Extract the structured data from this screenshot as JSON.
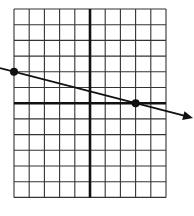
{
  "chart_data": {
    "type": "line",
    "title": "",
    "xlabel": "",
    "ylabel": "",
    "grid": true,
    "xlim": [
      -5,
      5
    ],
    "ylim": [
      -6,
      6
    ],
    "points": [
      {
        "x": -5,
        "y": 2
      },
      {
        "x": 3,
        "y": 0
      }
    ],
    "line": {
      "slope": -0.25,
      "intercept": 0.75,
      "arrow_right": true,
      "extends_left": true
    }
  },
  "layout": {
    "grid_left": 14,
    "grid_top": 9,
    "cell_w": 15.2,
    "cell_h": 15.7,
    "cols": 10,
    "rows": 12,
    "origin_col": 5,
    "origin_row": 6,
    "line_color": "#111111",
    "grid_color": "#333333"
  }
}
